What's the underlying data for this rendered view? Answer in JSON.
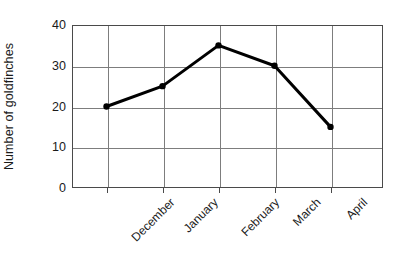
{
  "chart_data": {
    "type": "line",
    "title": "",
    "subtitle": "",
    "xlabel": "",
    "ylabel": "Number of goldfinches",
    "categories": [
      "December",
      "January",
      "February",
      "March",
      "April"
    ],
    "values": [
      20,
      25,
      35,
      30,
      15
    ],
    "series": [
      {
        "name": "Number of goldfinches",
        "values": [
          20,
          25,
          35,
          30,
          15
        ]
      }
    ],
    "ylim": [
      0,
      40
    ],
    "y_ticks": [
      0,
      10,
      20,
      30,
      40
    ],
    "y_tick_labels": [
      "0",
      "10",
      "20",
      "30",
      "40"
    ],
    "x_tick_labels": [
      "December",
      "January",
      "February",
      "March",
      "April"
    ],
    "grid": "horizontal-and-vertical",
    "legend": "none",
    "annotations": [],
    "colors": {
      "line": "#000000",
      "marker": "#000000",
      "gridline": "#7d7d7d",
      "axis": "#4a4a4a",
      "background": "#ffffff",
      "text": "#1a1a1a"
    },
    "style": {
      "x_tick_label_rotation_deg": -45,
      "y_label_rotation_deg": -90,
      "marker": "circle",
      "line_width_px": 3
    }
  }
}
